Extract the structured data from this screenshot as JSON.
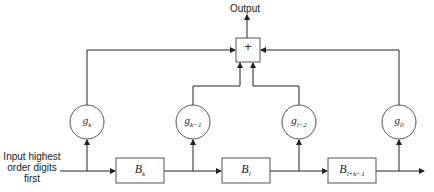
{
  "diagram": {
    "output_label": "Output",
    "adder_symbol": "+",
    "input_label": {
      "line1": "Input highest",
      "line2": "order digits",
      "line3": "first"
    },
    "multipliers": [
      {
        "base": "g",
        "sub": "k"
      },
      {
        "base": "g",
        "sub": "k−1"
      },
      {
        "base": "g",
        "sub": "l−2"
      },
      {
        "base": "g",
        "sub": "0"
      }
    ],
    "delay_blocks": [
      {
        "base": "B",
        "sub": "k"
      },
      {
        "base": "B",
        "sub": "l"
      },
      {
        "base": "B",
        "sub": "l+k−1"
      }
    ],
    "colors": {
      "line": "#222222",
      "box_border": "#555555",
      "background": "#ffffff"
    }
  }
}
